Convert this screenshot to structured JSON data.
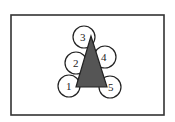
{
  "diagram": {
    "frame": {
      "x": 11,
      "y": 15,
      "width": 153,
      "height": 100,
      "stroke": "#333333"
    },
    "triangle": {
      "points": "91,36 76,87 107,87",
      "fill": "#555555",
      "stroke": "#222222"
    },
    "circles": [
      {
        "id": "1",
        "label": "1",
        "cx": 69,
        "cy": 86,
        "r": 11
      },
      {
        "id": "2",
        "label": "2",
        "cx": 76,
        "cy": 63,
        "r": 11
      },
      {
        "id": "3",
        "label": "3",
        "cx": 84,
        "cy": 37,
        "r": 11
      },
      {
        "id": "4",
        "label": "4",
        "cx": 105,
        "cy": 57,
        "r": 11
      },
      {
        "id": "5",
        "label": "5",
        "cx": 110,
        "cy": 87,
        "r": 11
      }
    ],
    "colors": {
      "line": "#222222",
      "fill": "#555555",
      "background": "#ffffff"
    }
  }
}
